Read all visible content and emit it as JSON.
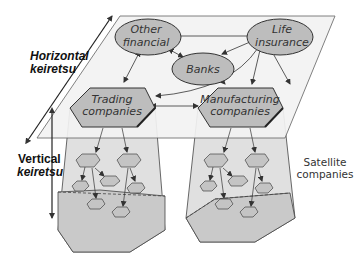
{
  "diagram": {
    "horizontal_label_line1": "Horizontal",
    "horizontal_label_line2": "keiretsu",
    "vertical_label_line1": "Vertical",
    "vertical_label_line2": "keiretsu",
    "satellite_label_line1": "Satellite",
    "satellite_label_line2": "companies",
    "nodes": {
      "other_financial": {
        "line1": "Other",
        "line2": "financial"
      },
      "life_insurance": {
        "line1": "Life",
        "line2": "insurance"
      },
      "banks": {
        "line1": "Banks"
      },
      "trading": {
        "line1": "Trading",
        "line2": "companies"
      },
      "manufacturing": {
        "line1": "Manufacturing",
        "line2": "companies"
      }
    },
    "colors": {
      "node_fill": "#bdbdbd",
      "plane_fill": "#f4f4f4",
      "pyramid_fill": "#d6d6d6",
      "stroke": "#333333"
    }
  }
}
